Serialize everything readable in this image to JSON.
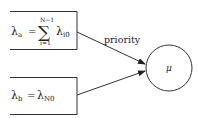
{
  "diagram": {
    "type": "queue-flow",
    "nodes": [
      {
        "id": "lambda-a-box",
        "shape": "rectangle-open-left",
        "lhs": "λ",
        "lhs_sub": "a",
        "equals": "=",
        "sum_symbol": "∑",
        "sum_upper": "N−1",
        "sum_lower": "i=1",
        "rhs": "λ",
        "rhs_sub": "i0"
      },
      {
        "id": "lambda-b-box",
        "shape": "rectangle-open-left",
        "lhs": "λ",
        "lhs_sub": "b",
        "equals": "=",
        "rhs": "λ",
        "rhs_sub": "N0"
      },
      {
        "id": "server",
        "shape": "circle",
        "label": "μ"
      }
    ],
    "edges": [
      {
        "from": "lambda-a-box",
        "to": "server",
        "label": "priority"
      },
      {
        "from": "lambda-b-box",
        "to": "server",
        "label": ""
      }
    ],
    "colors": {
      "stroke": "#333333",
      "text": "#222222"
    }
  }
}
